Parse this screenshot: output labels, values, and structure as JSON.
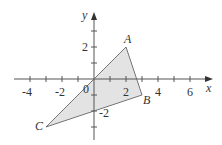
{
  "diagram": {
    "type": "coordinate-plane-triangle",
    "axes": {
      "x_label": "x",
      "y_label": "y",
      "origin_label": "0",
      "x_tick_labels": [
        "-4",
        "-2",
        "2",
        "4",
        "6"
      ],
      "y_tick_labels": [
        "2",
        "-2"
      ],
      "x_range": [
        -4,
        7
      ],
      "y_range": [
        -4,
        4
      ]
    },
    "points": [
      {
        "name": "A",
        "x": 2,
        "y": 2
      },
      {
        "name": "B",
        "x": 3,
        "y": -1
      },
      {
        "name": "C",
        "x": -3,
        "y": -3
      },
      {
        "name": "O",
        "x": 0,
        "y": 0
      }
    ],
    "shaded_region_color": "#e3e3e3",
    "line_color": "#555555"
  }
}
